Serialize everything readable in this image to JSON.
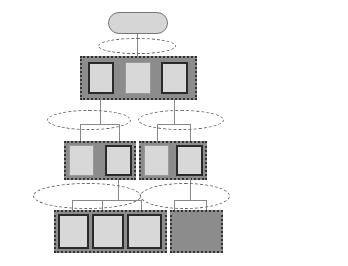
{
  "levels": [
    {
      "base": "Q",
      "sup": "W"
    },
    {
      "base": "Q",
      "sup": "F"
    },
    {
      "base": "Q",
      "sup": "M"
    },
    {
      "base": "Q",
      "sup": "A"
    }
  ],
  "root": {
    "base": "Q",
    "sup": "W"
  },
  "f_nodes": [
    {
      "base": "Q",
      "sup": "F",
      "sub": "1",
      "style": "thick"
    },
    {
      "base": "Q",
      "sup": "F",
      "sub": "2",
      "style": "thin"
    },
    {
      "base": "Q",
      "sup": "F",
      "sub": "3",
      "style": "thick"
    }
  ],
  "m_nodes": [
    {
      "base": "Q",
      "sup": "M",
      "sub": "11",
      "style": "thin"
    },
    {
      "base": "Q",
      "sup": "M",
      "sub": "12",
      "style": "thick"
    },
    {
      "base": "Q",
      "sup": "M",
      "sub": "21",
      "style": "thin"
    },
    {
      "base": "Q",
      "sup": "M",
      "sub": "22",
      "style": "thick"
    }
  ],
  "a_nodes": [
    {
      "base": "Q",
      "sup": "A",
      "sub": "121",
      "style": "thick"
    },
    {
      "base": "Q",
      "sup": "A",
      "sub": "122",
      "style": "thick"
    },
    {
      "base": "Q",
      "sup": "A",
      "sub": "123",
      "style": "thick"
    },
    {
      "base": "Q",
      "sup": "A",
      "sub": "221",
      "style": "thick"
    },
    {
      "base": "Q",
      "sup": "A",
      "sub": "222",
      "style": "thick"
    }
  ],
  "legend": {
    "dmm_label": "DMM",
    "dsm_label": "DSM",
    "rows": [
      {
        "dmm": "DMM",
        "dsm": "DSM"
      },
      {
        "dmm": "DMM",
        "dsm": "DSM"
      },
      {
        "dmm": "DMM",
        "dsm": "DSM"
      }
    ]
  },
  "colors": {
    "node_fill": "#d8d8d8",
    "group_fill": "#8c8c8c",
    "dsm_fill": "#8a8a8a",
    "pill_fill": "#d6d6d6",
    "dashed_stroke": "#666666",
    "thick_border": "#2a2a2a"
  }
}
